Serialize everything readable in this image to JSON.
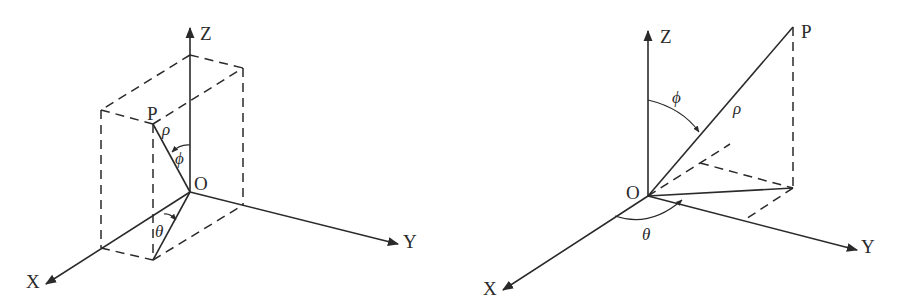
{
  "figures": [
    {
      "name": "rectangular-box-spherical-coordinates",
      "labels": {
        "z_axis": "Z",
        "y_axis": "Y",
        "x_axis": "X",
        "origin": "O",
        "point": "P",
        "rho": "ρ",
        "phi": "ϕ",
        "theta": "θ"
      }
    },
    {
      "name": "spherical-coordinates-projection",
      "labels": {
        "z_axis": "Z",
        "y_axis": "Y",
        "x_axis": "X",
        "origin": "O",
        "point": "P",
        "rho": "ρ",
        "phi": "ϕ",
        "theta": "θ"
      }
    }
  ],
  "colors": {
    "stroke": "#2a2a2a",
    "background": "#ffffff"
  }
}
